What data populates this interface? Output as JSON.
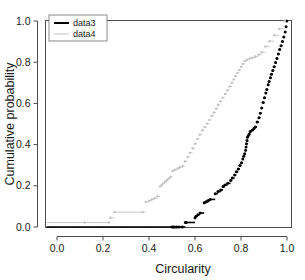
{
  "chart_data": {
    "type": "line",
    "title": "",
    "subtitle": "",
    "xlabel": "Circularity",
    "ylabel": "Cumulative probability",
    "xlim": [
      -0.04,
      1.04
    ],
    "ylim": [
      -0.05,
      1.05
    ],
    "xticks": [
      0.0,
      0.2,
      0.4,
      0.6,
      0.8,
      1.0
    ],
    "xticklabels": [
      "0.0",
      "0.2",
      "0.4",
      "0.6",
      "0.8",
      "1.0"
    ],
    "yticks": [
      0.0,
      0.2,
      0.4,
      0.6,
      0.8,
      1.0
    ],
    "yticklabels": [
      "0.0",
      "0.2",
      "0.4",
      "0.6",
      "0.8",
      "1.0"
    ],
    "grid": true,
    "gridlines_y": [
      0.0,
      1.0
    ],
    "grid_color": "#e2e2e2",
    "legend_position": "top-left",
    "step_style": "ecdf",
    "series": [
      {
        "name": "data3",
        "color": "#000000",
        "line_width": 1.6,
        "marker": "circle",
        "marker_size": 3.0,
        "x": [
          0.5,
          0.505,
          0.512,
          0.52,
          0.53,
          0.545,
          0.558,
          0.56,
          0.562,
          0.6,
          0.604,
          0.612,
          0.622,
          0.64,
          0.648,
          0.655,
          0.66,
          0.666,
          0.688,
          0.7,
          0.712,
          0.722,
          0.73,
          0.742,
          0.755,
          0.762,
          0.772,
          0.78,
          0.788,
          0.795,
          0.802,
          0.808,
          0.812,
          0.816,
          0.82,
          0.822,
          0.824,
          0.826,
          0.828,
          0.832,
          0.836,
          0.84,
          0.848,
          0.856,
          0.862,
          0.87,
          0.878,
          0.884,
          0.89,
          0.896,
          0.902,
          0.908,
          0.912,
          0.918,
          0.922,
          0.928,
          0.932,
          0.938,
          0.944,
          0.95,
          0.956,
          0.962,
          0.968,
          0.974,
          0.98,
          0.986,
          0.992,
          0.996,
          0.999
        ],
        "y": [
          0.0,
          0.0,
          0.0,
          0.0,
          0.0,
          0.0,
          0.022,
          0.022,
          0.022,
          0.045,
          0.052,
          0.06,
          0.068,
          0.118,
          0.122,
          0.126,
          0.13,
          0.134,
          0.162,
          0.172,
          0.18,
          0.196,
          0.204,
          0.212,
          0.226,
          0.238,
          0.252,
          0.268,
          0.282,
          0.298,
          0.312,
          0.33,
          0.344,
          0.356,
          0.372,
          0.388,
          0.404,
          0.42,
          0.436,
          0.444,
          0.452,
          0.464,
          0.47,
          0.478,
          0.486,
          0.51,
          0.53,
          0.552,
          0.578,
          0.604,
          0.628,
          0.65,
          0.668,
          0.69,
          0.706,
          0.724,
          0.742,
          0.76,
          0.778,
          0.798,
          0.818,
          0.84,
          0.862,
          0.88,
          0.9,
          0.922,
          0.946,
          0.972,
          1.0
        ]
      },
      {
        "name": "data4",
        "color": "#c2c2c2",
        "line_width": 0.9,
        "marker": "circle",
        "marker_size": 2.4,
        "x": [
          0.12,
          0.225,
          0.232,
          0.25,
          0.372,
          0.385,
          0.4,
          0.412,
          0.424,
          0.436,
          0.448,
          0.455,
          0.462,
          0.47,
          0.478,
          0.486,
          0.494,
          0.502,
          0.512,
          0.524,
          0.534,
          0.546,
          0.556,
          0.568,
          0.578,
          0.59,
          0.6,
          0.61,
          0.62,
          0.632,
          0.642,
          0.652,
          0.662,
          0.672,
          0.682,
          0.692,
          0.7,
          0.71,
          0.72,
          0.73,
          0.74,
          0.75,
          0.76,
          0.768,
          0.776,
          0.784,
          0.792,
          0.8,
          0.808,
          0.816,
          0.826,
          0.838,
          0.85,
          0.862,
          0.876,
          0.89,
          0.906,
          0.924,
          0.944,
          0.966,
          0.99
        ],
        "y": [
          0.022,
          0.022,
          0.045,
          0.072,
          0.072,
          0.122,
          0.128,
          0.134,
          0.14,
          0.148,
          0.196,
          0.204,
          0.212,
          0.22,
          0.228,
          0.236,
          0.244,
          0.272,
          0.278,
          0.284,
          0.29,
          0.296,
          0.318,
          0.34,
          0.36,
          0.382,
          0.404,
          0.428,
          0.448,
          0.47,
          0.486,
          0.502,
          0.52,
          0.54,
          0.556,
          0.574,
          0.592,
          0.61,
          0.628,
          0.646,
          0.664,
          0.682,
          0.7,
          0.716,
          0.732,
          0.748,
          0.762,
          0.778,
          0.792,
          0.806,
          0.812,
          0.818,
          0.822,
          0.828,
          0.836,
          0.848,
          0.876,
          0.902,
          0.93,
          0.962,
          1.0
        ]
      }
    ]
  },
  "legend": {
    "entries": [
      {
        "label": "data3"
      },
      {
        "label": "data4"
      }
    ]
  }
}
